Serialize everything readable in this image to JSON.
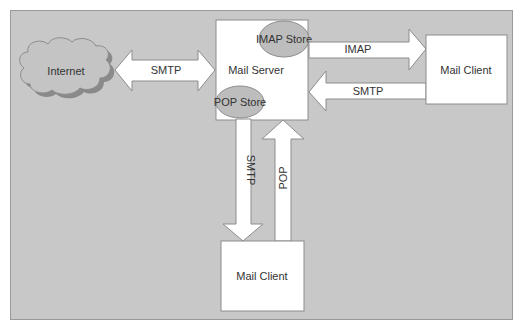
{
  "diagram": {
    "colors": {
      "background": "#c8c8c8",
      "box_fill": "#ffffff",
      "store_fill": "#bdbdbd",
      "cloud_fill": "#c4c4c4",
      "cloud_shadow": "#8a8a8a",
      "stroke": "#8c8c8c",
      "text": "#333333"
    },
    "nodes": {
      "internet": "Internet",
      "mail_server": "Mail Server",
      "imap_store": "IMAP Store",
      "pop_store": "POP Store",
      "mail_client_right": "Mail Client",
      "mail_client_bottom": "Mail Client"
    },
    "edges": {
      "internet_server": "SMTP",
      "server_to_right_client": "IMAP",
      "right_client_to_server": "SMTP",
      "server_to_bottom_client": "SMTP",
      "bottom_client_to_server": "POP"
    }
  }
}
